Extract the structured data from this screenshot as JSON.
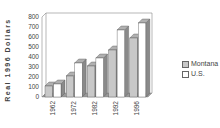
{
  "chart_data": {
    "type": "bar",
    "style": "3d-clustered",
    "title": "",
    "xlabel": "",
    "ylabel": "Real 1996 Dollars",
    "categories": [
      "1962",
      "1972",
      "1982",
      "1992",
      "1996"
    ],
    "series": [
      {
        "name": "Montana",
        "values": [
          110,
          210,
          310,
          470,
          590
        ],
        "color": "#c8c8c8"
      },
      {
        "name": "U.S.",
        "values": [
          130,
          340,
          390,
          670,
          740
        ],
        "color": "#ffffff"
      }
    ],
    "ylim": [
      0,
      800
    ],
    "yticks": [
      0,
      100,
      200,
      300,
      400,
      500,
      600,
      700,
      800
    ],
    "grid": false,
    "legend_position": "right"
  },
  "legend": {
    "items": [
      {
        "label": "Montana"
      },
      {
        "label": "U.S."
      }
    ]
  }
}
